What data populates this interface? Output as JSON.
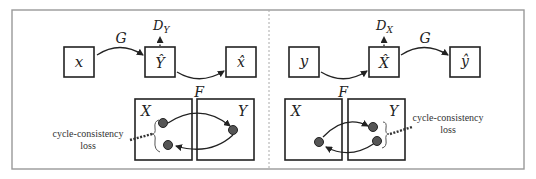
{
  "left_panel": {
    "nodes": {
      "input": "x",
      "generated": "Ŷ",
      "reconstructed": "x̂"
    },
    "discriminator_label": "D",
    "discriminator_sub": "Y",
    "forward_mapping_label": "G",
    "backward_mapping_label": "F",
    "domain_a_label": "X",
    "domain_b_label": "Y",
    "loss_label_line1": "cycle-consistency",
    "loss_label_line2": "loss"
  },
  "right_panel": {
    "nodes": {
      "input": "y",
      "generated": "X̂",
      "reconstructed": "ŷ"
    },
    "discriminator_label": "D",
    "discriminator_sub": "X",
    "forward_mapping_label": "F",
    "backward_mapping_label": "G",
    "domain_a_label": "X",
    "domain_b_label": "Y",
    "loss_label_line1": "cycle-consistency",
    "loss_label_line2": "loss"
  }
}
